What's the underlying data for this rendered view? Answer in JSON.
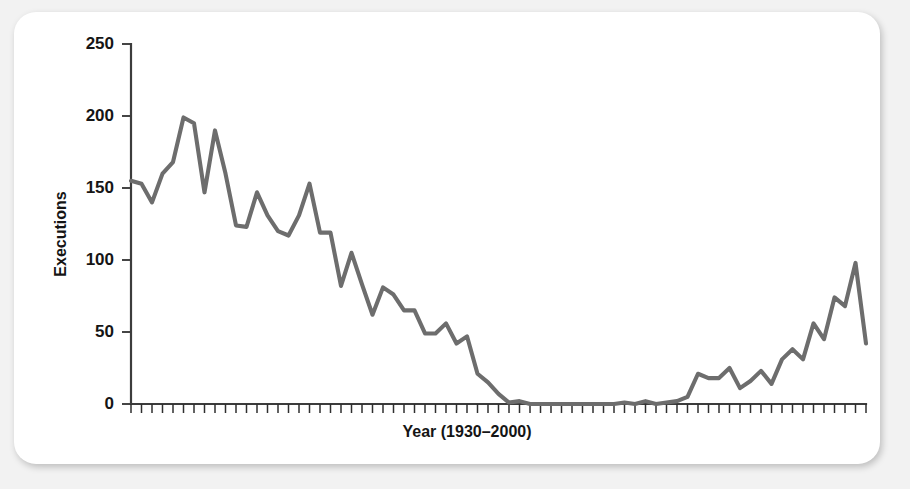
{
  "figure": {
    "background_color": "#f2f2f2",
    "card_color": "#ffffff",
    "line_color": "#6d6d6d",
    "axis_color": "#3c3c3c",
    "text_color": "#151515"
  },
  "chart_data": {
    "type": "line",
    "title": "",
    "subtitle": "",
    "xlabel": "Year (1930–2000)",
    "ylabel": "Executions",
    "xlim": [
      1930,
      2000
    ],
    "ylim": [
      0,
      250
    ],
    "grid": false,
    "legend": null,
    "legend_position": "none",
    "y_ticks": [
      0,
      50,
      100,
      150,
      200,
      250
    ],
    "y_tick_labels": [
      "0",
      "50",
      "100",
      "150",
      "200",
      "250"
    ],
    "x_tick_interval": 1,
    "x_tick_labels_shown": false,
    "annotations": [],
    "x": [
      1930,
      1931,
      1932,
      1933,
      1934,
      1935,
      1936,
      1937,
      1938,
      1939,
      1940,
      1941,
      1942,
      1943,
      1944,
      1945,
      1946,
      1947,
      1948,
      1949,
      1950,
      1951,
      1952,
      1953,
      1954,
      1955,
      1956,
      1957,
      1958,
      1959,
      1960,
      1961,
      1962,
      1963,
      1964,
      1965,
      1966,
      1967,
      1968,
      1969,
      1970,
      1971,
      1972,
      1973,
      1974,
      1975,
      1976,
      1977,
      1978,
      1979,
      1980,
      1981,
      1982,
      1983,
      1984,
      1985,
      1986,
      1987,
      1988,
      1989,
      1990,
      1991,
      1992,
      1993,
      1994,
      1995,
      1996,
      1997,
      1998,
      1999,
      2000
    ],
    "values": [
      155,
      153,
      140,
      160,
      168,
      199,
      195,
      147,
      190,
      160,
      124,
      123,
      147,
      131,
      120,
      117,
      131,
      153,
      119,
      119,
      82,
      105,
      83,
      62,
      81,
      76,
      65,
      65,
      49,
      49,
      56,
      42,
      47,
      21,
      15,
      7,
      1,
      2,
      0,
      0,
      0,
      0,
      0,
      0,
      0,
      0,
      0,
      1,
      0,
      2,
      0,
      1,
      2,
      5,
      21,
      18,
      18,
      25,
      11,
      16,
      23,
      14,
      31,
      38,
      31,
      56,
      45,
      74,
      68,
      98,
      42
    ]
  }
}
